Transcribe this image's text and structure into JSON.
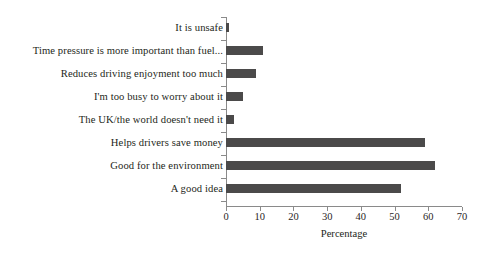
{
  "chart_data": {
    "type": "bar",
    "orientation": "horizontal",
    "title": "",
    "xlabel": "Percentage",
    "ylabel": "",
    "xlim": [
      0,
      70
    ],
    "xticks": [
      0,
      10,
      20,
      30,
      40,
      50,
      60,
      70
    ],
    "xtick_labels": [
      "0",
      "10",
      "20",
      "30",
      "40",
      "50",
      "60",
      "70"
    ],
    "grid": false,
    "legend": null,
    "bar_color": "#4b4a4a",
    "axis_color": "#8a8a8a",
    "categories": [
      "It is unsafe",
      "Time pressure is more important than fuel...",
      "Reduces driving enjoyment too much",
      "I'm too busy to worry about it",
      "The UK/the world doesn't need it",
      "Helps drivers save money",
      "Good for the environment",
      "A good idea"
    ],
    "values": [
      1,
      11,
      9,
      5,
      2.5,
      59,
      62,
      52
    ]
  }
}
